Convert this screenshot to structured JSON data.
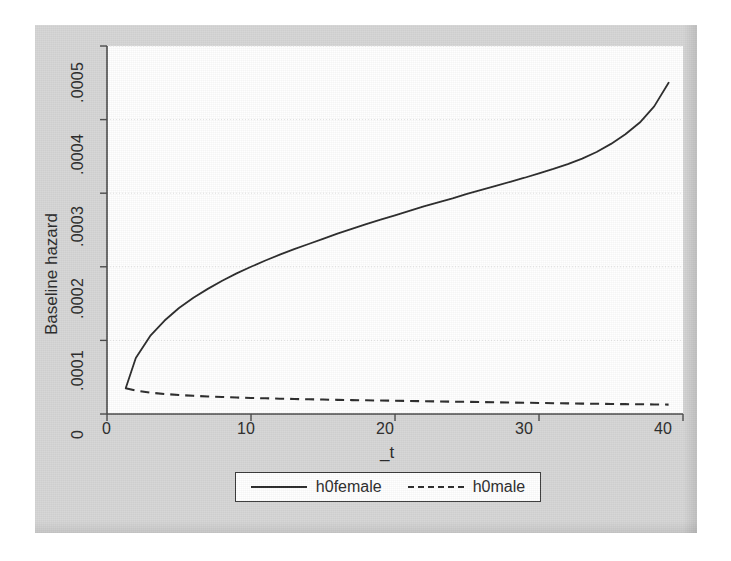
{
  "figure": {
    "background_color": "#d6d6d6",
    "plot_background_color": "#ffffff",
    "line_color": "#2b2b2b",
    "grid_color": "#e2e2e2"
  },
  "axes": {
    "y_title": "Baseline hazard",
    "x_title": "_t",
    "y_ticks": [
      "0",
      ".0001",
      ".0002",
      ".0003",
      ".0004",
      ".0005"
    ],
    "x_ticks": [
      "0",
      "10",
      "20",
      "30",
      "40"
    ]
  },
  "legend": {
    "entries": [
      {
        "label": "h0female",
        "style": "solid"
      },
      {
        "label": "h0male",
        "style": "dashed"
      }
    ]
  },
  "chart_data": {
    "type": "line",
    "title": "",
    "subtitle": "",
    "xlabel": "_t",
    "ylabel": "Baseline hazard",
    "xlim": [
      0,
      40
    ],
    "ylim": [
      0,
      0.0005
    ],
    "xticks": [
      0,
      10,
      20,
      30,
      40
    ],
    "yticks": [
      0,
      0.0001,
      0.0002,
      0.0003,
      0.0004,
      0.0005
    ],
    "grid": "horizontal-dotted",
    "legend_position": "below-plot-centered",
    "annotations": [],
    "series": [
      {
        "name": "h0female",
        "style": "solid",
        "color": "#2b2b2b",
        "x": [
          1.3,
          2,
          3,
          4,
          5,
          6,
          7,
          8,
          9,
          10,
          11,
          12,
          13,
          14,
          15,
          16,
          17,
          18,
          19,
          20,
          21,
          22,
          23,
          24,
          25,
          26,
          27,
          28,
          29,
          30,
          31,
          32,
          33,
          34,
          35,
          36,
          37,
          38,
          39
        ],
        "y": [
          3.5e-05,
          7.6e-05,
          0.000106,
          0.000127,
          0.000144,
          0.000158,
          0.00017,
          0.000181,
          0.000191,
          0.0002,
          0.0002085,
          0.0002165,
          0.000224,
          0.000231,
          0.000238,
          0.000245,
          0.0002515,
          0.000258,
          0.000264,
          0.00027,
          0.000276,
          0.000282,
          0.0002875,
          0.000293,
          0.000299,
          0.0003045,
          0.00031,
          0.0003155,
          0.000321,
          0.000327,
          0.000333,
          0.0003395,
          0.000347,
          0.000356,
          0.000367,
          0.00038,
          0.000396,
          0.000418,
          0.00045
        ]
      },
      {
        "name": "h0male",
        "style": "dashed",
        "color": "#2b2b2b",
        "x": [
          1.3,
          2,
          3,
          4,
          5,
          6,
          7,
          8,
          9,
          10,
          11,
          12,
          13,
          14,
          15,
          16,
          17,
          18,
          19,
          20,
          21,
          22,
          23,
          24,
          25,
          26,
          27,
          28,
          29,
          30,
          31,
          32,
          33,
          34,
          35,
          36,
          37,
          38,
          39
        ],
        "y": [
          3.5e-05,
          3.18e-05,
          2.9e-05,
          2.72e-05,
          2.58e-05,
          2.47e-05,
          2.38e-05,
          2.31e-05,
          2.24e-05,
          2.18e-05,
          2.13e-05,
          2.08e-05,
          2.04e-05,
          2e-05,
          1.96e-05,
          1.92e-05,
          1.89e-05,
          1.86e-05,
          1.83e-05,
          1.8e-05,
          1.77e-05,
          1.74e-05,
          1.71e-05,
          1.68e-05,
          1.65e-05,
          1.62e-05,
          1.59e-05,
          1.56e-05,
          1.53e-05,
          1.5e-05,
          1.47e-05,
          1.44e-05,
          1.41e-05,
          1.39e-05,
          1.36e-05,
          1.34e-05,
          1.32e-05,
          1.3e-05,
          1.28e-05
        ]
      }
    ]
  }
}
